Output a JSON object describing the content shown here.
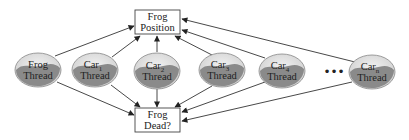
{
  "diagram": {
    "boxes": {
      "position": {
        "line1": "Frog",
        "line2": "Position"
      },
      "dead": {
        "line1": "Frog",
        "line2": "Dead?"
      }
    },
    "threads": [
      {
        "name": "Frog",
        "sub": "",
        "label": "Thread"
      },
      {
        "name": "Car",
        "sub": "1",
        "label": "Thread"
      },
      {
        "name": "Car",
        "sub": "2",
        "label": "Thread"
      },
      {
        "name": "Car",
        "sub": "3",
        "label": "Thread"
      },
      {
        "name": "Car",
        "sub": "4",
        "label": "Thread"
      },
      {
        "name": "Car",
        "sub": "n",
        "label": "Thread"
      }
    ],
    "ellipsis": "•••",
    "colors": {
      "ellipse_fill": "#e6e6e6",
      "ellipse_shade": "#8a8a8a",
      "line": "#333333",
      "box_border": "#444444"
    }
  }
}
